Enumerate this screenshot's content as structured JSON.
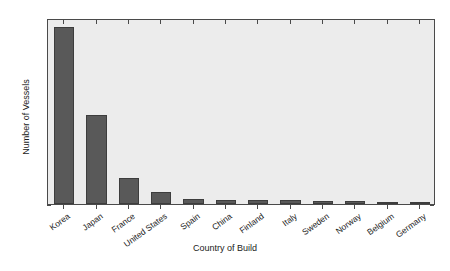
{
  "figure": {
    "caption_fragment": "",
    "colors": {
      "bar_fill": "#595959",
      "bar_edge": "#3d3d3d",
      "plot_background": "#ececec",
      "axis": "#4a4a4a",
      "text": "#1a1a1a"
    }
  },
  "chart_data": {
    "type": "bar",
    "title": "",
    "xlabel": "Country of Build",
    "ylabel": "Number of Vessels",
    "categories": [
      "Korea",
      "Japan",
      "France",
      "United States",
      "Spain",
      "China",
      "Finland",
      "Italy",
      "Sweden",
      "Norway",
      "Belgium",
      "Germany"
    ],
    "values": [
      190,
      96,
      28,
      13,
      5,
      4,
      4,
      4,
      3,
      3,
      1,
      1
    ],
    "ylim": [
      0,
      200
    ],
    "yticks": [
      0,
      20,
      40,
      60,
      80,
      100,
      120,
      140,
      160,
      180,
      200
    ],
    "ytick_labels": [
      "0",
      "20",
      "40",
      "60",
      "80",
      "100",
      "120",
      "140",
      "160",
      "180",
      "200"
    ],
    "grid": false,
    "legend": null
  }
}
